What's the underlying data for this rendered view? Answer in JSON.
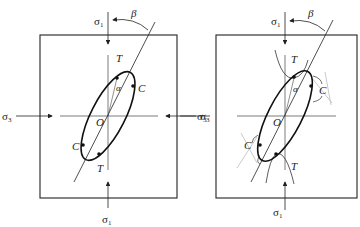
{
  "panels": [
    {
      "id": "left",
      "labels": {
        "sigma1_top": "σ",
        "sigma1_top_sub": "1",
        "sigma1_bottom": "σ",
        "sigma1_bottom_sub": "1",
        "sigma3_left": "σ",
        "sigma3_left_sub": "3",
        "sigma3_right": "σ",
        "sigma3_right_sub": "3",
        "beta": "β",
        "alpha": "α",
        "origin": "O",
        "T_top": "T",
        "T_bottom": "T",
        "C_top": "C",
        "C_bottom": "C"
      }
    },
    {
      "id": "right",
      "labels": {
        "sigma1_top": "σ",
        "sigma1_top_sub": "1",
        "sigma1_bottom": "σ",
        "sigma1_bottom_sub": "1",
        "sigma3_left": "σ",
        "sigma3_left_sub": "3",
        "beta": "β",
        "alpha": "α",
        "origin": "O",
        "T_top": "T",
        "T_bottom": "T",
        "C_top": "C",
        "C_bottom": "C"
      }
    }
  ],
  "colors": {
    "stroke": "#222222",
    "light_stroke": "#bbbbbb",
    "background": "#ffffff"
  }
}
